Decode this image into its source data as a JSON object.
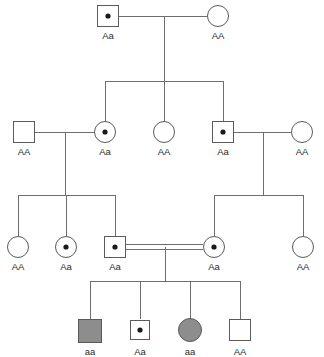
{
  "figure": {
    "type": "pedigree-chart",
    "canvas": {
      "width": 324,
      "height": 357
    },
    "background_color": "#ffffff",
    "line_color": "#6e6e6e",
    "symbol_stroke_color": "#5a5a5a",
    "unaffected_fill": "#ffffff",
    "affected_fill": "#8d8d8d",
    "carrier_dot_color": "#1a1a1a"
  },
  "legend_semantics": {
    "square": "male",
    "circle": "female",
    "filled": "affected homozygous recessive",
    "center_dot": "unaffected carrier heterozygous",
    "empty": "unaffected homozygous dominant",
    "double_line": "consanguineous mating"
  },
  "generations": [
    {
      "id": "I",
      "individuals": [
        {
          "id": "I-1",
          "sex": "male",
          "shape": "square",
          "status": "carrier",
          "genotype": "Aa",
          "cx": 108,
          "cy": 16
        },
        {
          "id": "I-2",
          "sex": "female",
          "shape": "circle",
          "status": "unaffected",
          "genotype": "AA",
          "cx": 218,
          "cy": 16
        }
      ]
    },
    {
      "id": "II",
      "individuals": [
        {
          "id": "II-1",
          "sex": "male",
          "shape": "square",
          "status": "unaffected",
          "genotype": "AA",
          "cx": 24,
          "cy": 132
        },
        {
          "id": "II-2",
          "sex": "female",
          "shape": "circle",
          "status": "carrier",
          "genotype": "Aa",
          "cx": 105,
          "cy": 132
        },
        {
          "id": "II-3",
          "sex": "female",
          "shape": "circle",
          "status": "unaffected",
          "genotype": "AA",
          "cx": 164,
          "cy": 132
        },
        {
          "id": "II-4",
          "sex": "male",
          "shape": "square",
          "status": "carrier",
          "genotype": "Aa",
          "cx": 223,
          "cy": 132
        },
        {
          "id": "II-5",
          "sex": "female",
          "shape": "circle",
          "status": "unaffected",
          "genotype": "AA",
          "cx": 302,
          "cy": 132
        }
      ]
    },
    {
      "id": "III",
      "individuals": [
        {
          "id": "III-1",
          "sex": "female",
          "shape": "circle",
          "status": "unaffected",
          "genotype": "AA",
          "cx": 18,
          "cy": 247
        },
        {
          "id": "III-2",
          "sex": "female",
          "shape": "circle",
          "status": "carrier",
          "genotype": "Aa",
          "cx": 66,
          "cy": 247
        },
        {
          "id": "III-3",
          "sex": "male",
          "shape": "square",
          "status": "carrier",
          "genotype": "Aa",
          "cx": 115,
          "cy": 247
        },
        {
          "id": "III-4",
          "sex": "female",
          "shape": "circle",
          "status": "carrier",
          "genotype": "Aa",
          "cx": 214,
          "cy": 247
        },
        {
          "id": "III-5",
          "sex": "female",
          "shape": "circle",
          "status": "unaffected",
          "genotype": "AA",
          "cx": 303,
          "cy": 247
        }
      ]
    },
    {
      "id": "IV",
      "individuals": [
        {
          "id": "IV-1",
          "sex": "male",
          "shape": "square",
          "status": "affected",
          "genotype": "aa",
          "cx": 90,
          "cy": 330
        },
        {
          "id": "IV-2",
          "sex": "male",
          "shape": "square",
          "status": "carrier",
          "genotype": "Aa",
          "cx": 140,
          "cy": 330
        },
        {
          "id": "IV-3",
          "sex": "female",
          "shape": "circle",
          "status": "affected",
          "genotype": "aa",
          "cx": 190,
          "cy": 330
        },
        {
          "id": "IV-4",
          "sex": "male",
          "shape": "square",
          "status": "unaffected",
          "genotype": "AA",
          "cx": 240,
          "cy": 330
        }
      ]
    }
  ],
  "matings": [
    {
      "id": "mating-I",
      "partners": [
        "I-1",
        "I-2"
      ],
      "consanguineous": false
    },
    {
      "id": "mating-II-a",
      "partners": [
        "II-1",
        "II-2"
      ],
      "consanguineous": false
    },
    {
      "id": "mating-II-b",
      "partners": [
        "II-4",
        "II-5"
      ],
      "consanguineous": false
    },
    {
      "id": "mating-III",
      "partners": [
        "III-3",
        "III-4"
      ],
      "consanguineous": true
    }
  ],
  "sibships": [
    {
      "id": "sibship-II",
      "parents": "mating-I",
      "children": [
        "II-2",
        "II-3",
        "II-4"
      ]
    },
    {
      "id": "sibship-III-a",
      "parents": "mating-II-a",
      "children": [
        "III-1",
        "III-2",
        "III-3"
      ]
    },
    {
      "id": "sibship-III-b",
      "parents": "mating-II-b",
      "children": [
        "III-4",
        "III-5"
      ]
    },
    {
      "id": "sibship-IV",
      "parents": "mating-III",
      "children": [
        "IV-1",
        "IV-2",
        "IV-3",
        "IV-4"
      ]
    }
  ],
  "labels": {
    "I_1": "Aa",
    "I_2": "AA",
    "II_1": "AA",
    "II_2": "Aa",
    "II_3": "AA",
    "II_4": "Aa",
    "II_5": "AA",
    "III_1": "AA",
    "III_2": "Aa",
    "III_3": "Aa",
    "III_4": "Aa",
    "III_5": "AA",
    "IV_1": "aa",
    "IV_2": "Aa",
    "IV_3": "aa",
    "IV_4": "AA"
  }
}
